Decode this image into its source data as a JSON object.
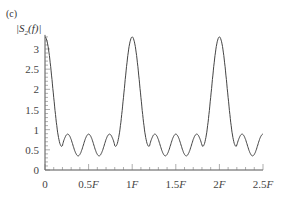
{
  "chart_data": {
    "type": "line",
    "panel_label": "(c)",
    "title": "",
    "xlabel": "",
    "ylabel": "|S2(f)|",
    "x_ticks": [
      "0",
      "0.5F",
      "1F",
      "1.5F",
      "2F",
      "2.5F"
    ],
    "y_ticks": [
      "0",
      "0.5",
      "1",
      "1.5",
      "2",
      "2.5",
      "3"
    ],
    "xlim": [
      0,
      2.5
    ],
    "ylim": [
      0,
      3.4
    ],
    "grid": false,
    "legend": null,
    "series": [
      {
        "name": "|S2(f)|",
        "x": [
          0,
          0.05,
          0.1,
          0.15,
          0.2,
          0.3,
          0.4,
          0.5,
          0.6,
          0.7,
          0.8,
          0.85,
          0.9,
          0.95,
          1.0,
          1.05,
          1.1,
          1.15,
          1.2,
          1.3,
          1.4,
          1.5,
          1.6,
          1.7,
          1.8,
          1.85,
          1.9,
          1.95,
          2.0,
          2.05,
          2.1,
          2.15,
          2.2,
          2.3,
          2.4,
          2.5
        ],
        "y": [
          3.3,
          2.7,
          1.6,
          0.7,
          0.6,
          0.9,
          0.35,
          0.72,
          0.35,
          0.9,
          0.6,
          0.7,
          1.6,
          2.7,
          3.3,
          2.7,
          1.6,
          0.7,
          0.6,
          0.9,
          0.35,
          0.72,
          0.35,
          0.9,
          0.6,
          0.7,
          1.6,
          2.7,
          3.3,
          2.7,
          1.6,
          0.7,
          0.6,
          0.9,
          0.35,
          0.65
        ]
      }
    ]
  }
}
